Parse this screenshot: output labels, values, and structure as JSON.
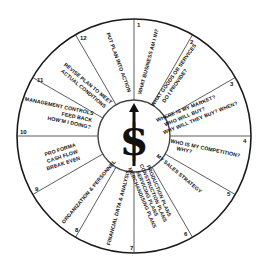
{
  "diagram": {
    "type": "business-planning-wheel",
    "center": {
      "symbol": "$",
      "icon": "dollar-sign-with-arrow-icon"
    },
    "colors": {
      "line": "#1a1a1a",
      "background": "#ffffff",
      "text": "#111111"
    },
    "segments": [
      {
        "number": "1",
        "lines": [
          "WHAT BUSINESS AM I IN?"
        ]
      },
      {
        "number": "2",
        "lines": [
          "WHAT GOODS OR SERVICES",
          "DO I PROVIDE?"
        ]
      },
      {
        "number": "3",
        "lines": [
          "WHERE IS MY MARKET?",
          "WHO WILL BUY?",
          "WHY WILL THEY BUY? WHEN?"
        ]
      },
      {
        "number": "4",
        "lines": [
          "WHO IS MY COMPETITION?",
          "WHY?"
        ]
      },
      {
        "number": "5",
        "lines": [
          "MY SALES STRATEGY"
        ]
      },
      {
        "number": "6",
        "lines": [
          "PRODUCTION PLANS",
          "CONSTRUCTION PLANS",
          "SERVICING PLANS",
          "MERCHANDISING PLANS"
        ]
      },
      {
        "number": "7",
        "lines": [
          "FINANCIAL DATA & ANALYSIS"
        ]
      },
      {
        "number": "8",
        "lines": [
          "ORGANIZATION & PERSONNEL"
        ]
      },
      {
        "number": "9",
        "lines": [
          "PRO FORMA",
          "CASH FLOW",
          "BREAK EVEN"
        ]
      },
      {
        "number": "10",
        "lines": [
          "MANAGEMENT CONTROLS",
          "FEED BACK",
          "HOW'M I DOING?"
        ]
      },
      {
        "number": "11",
        "lines": [
          "REVISE PLAN TO MEET",
          "ACTUAL CONDITIONS"
        ]
      },
      {
        "number": "12",
        "lines": [
          "PUT PLAN INTO ACTION"
        ]
      }
    ]
  }
}
